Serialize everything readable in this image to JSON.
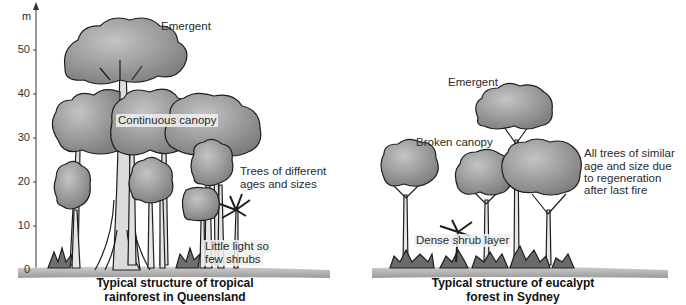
{
  "axis": {
    "unit": "m",
    "ticks": [
      "50",
      "40",
      "30",
      "20",
      "10",
      "0"
    ]
  },
  "left_diagram": {
    "labels": {
      "emergent": "Emergent",
      "canopy": "Continuous canopy",
      "trees": [
        "Trees of different",
        "ages and sizes"
      ],
      "light": [
        "Little light so",
        "few shrubs"
      ]
    },
    "caption": [
      "Typical structure of tropical",
      "rainforest in Queensland"
    ]
  },
  "right_diagram": {
    "labels": {
      "emergent": "Emergent",
      "canopy": "Broken canopy",
      "similar": [
        "All trees of similar",
        "age and size due",
        "to regeneration",
        "after last fire"
      ],
      "shrub": "Dense shrub layer"
    },
    "caption": [
      "Typical structure of eucalypt",
      "forest in Sydney"
    ]
  },
  "colors": {
    "crown": "#8f8f8f",
    "crown_light": "#b8b8b8",
    "trunk": "#e6e6e6",
    "outline": "#1e1e1e",
    "ground": "#a6a6a6"
  }
}
